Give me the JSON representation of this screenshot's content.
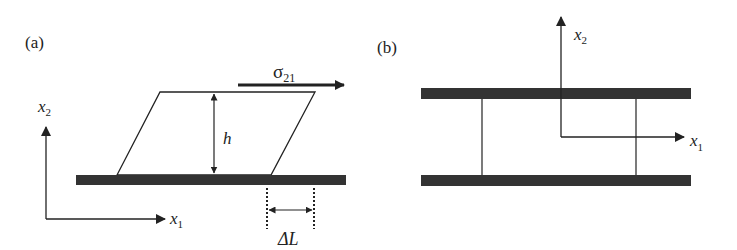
{
  "figure": {
    "panel_a": {
      "label": "(a)",
      "stress_label": "σ",
      "stress_sub": "21",
      "height_label": "h",
      "displacement_label": "ΔL",
      "axis_x1": {
        "var": "x",
        "sub": "1"
      },
      "axis_x2": {
        "var": "x",
        "sub": "2"
      }
    },
    "panel_b": {
      "label": "(b)",
      "axis_x1": {
        "var": "x",
        "sub": "1"
      },
      "axis_x2": {
        "var": "x",
        "sub": "2"
      }
    },
    "colors": {
      "plate": "#333333",
      "line": "#222222"
    }
  }
}
